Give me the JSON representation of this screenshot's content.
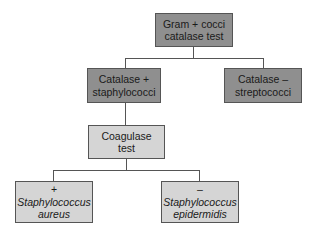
{
  "diagram": {
    "type": "flowchart",
    "colors": {
      "dark_box": "#8f8f8f",
      "light_box": "#d5d5d5",
      "line": "#555555"
    },
    "nodes": {
      "root": {
        "line1": "Gram + cocci",
        "line2": "catalase test"
      },
      "catalase_pos": {
        "line1": "Catalase +",
        "line2": "staphylococci"
      },
      "catalase_neg": {
        "line1": "Catalase –",
        "line2": "streptococci"
      },
      "coagulase": {
        "line1": "Coagulase",
        "line2": "test"
      },
      "aureus": {
        "sign": "+",
        "line1": "Staphylococcus",
        "line2": "aureus"
      },
      "epidermidis": {
        "sign": "–",
        "line1": "Staphylococcus",
        "line2": "epidermidis"
      }
    },
    "edges": [
      {
        "from": "root",
        "to": "catalase_pos"
      },
      {
        "from": "root",
        "to": "catalase_neg"
      },
      {
        "from": "catalase_pos",
        "to": "coagulase"
      },
      {
        "from": "coagulase",
        "to": "aureus"
      },
      {
        "from": "coagulase",
        "to": "epidermidis"
      }
    ]
  }
}
